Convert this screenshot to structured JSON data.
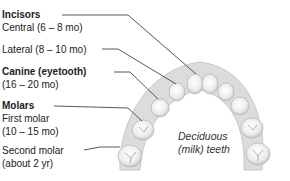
{
  "diagram": {
    "caption_line1": "Deciduous",
    "caption_line2": "(milk) teeth",
    "labels": {
      "incisors": {
        "heading": "Incisors",
        "central": "Central (6 – 8 mo)",
        "lateral": "Lateral (8 – 10 mo)"
      },
      "canine": {
        "heading": "Canine (eyetooth)",
        "range": "(16 – 20 mo)"
      },
      "molars": {
        "heading": "Molars",
        "first": "First molar",
        "first_range": "(10 – 15 mo)",
        "second": "Second molar",
        "second_range": "(about 2 yr)"
      }
    },
    "colors": {
      "text": "#222222",
      "line": "#444444",
      "gum": "#d8d8d8",
      "tooth": "#f4f4f4",
      "tooth_shadow": "#bdbdbd"
    }
  }
}
